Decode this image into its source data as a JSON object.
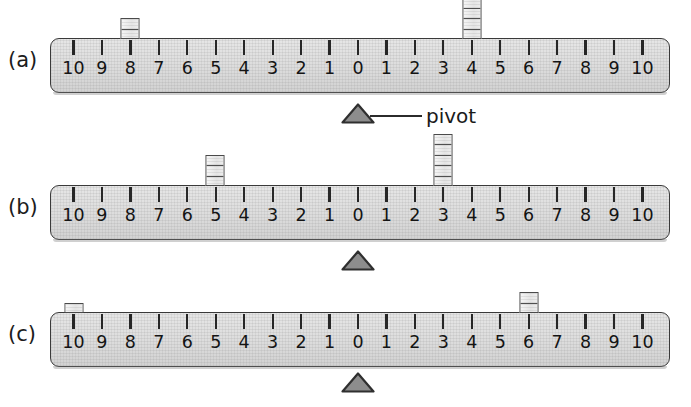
{
  "figure": {
    "background_color": "#ffffff",
    "beam_fill": "#e0e0e0",
    "beam_stroke": "#3a3a3a",
    "pivot_fill": "#8d8d8d",
    "pivot_stroke": "#2f2f2f",
    "weight_fill": "#ededed",
    "weight_stroke": "#4a4a4a",
    "tick_color": "#262626"
  },
  "scale_labels": [
    "10",
    "9",
    "8",
    "7",
    "6",
    "5",
    "4",
    "3",
    "2",
    "1",
    "0",
    "1",
    "2",
    "3",
    "4",
    "5",
    "6",
    "7",
    "8",
    "9",
    "10"
  ],
  "callout": {
    "label": "pivot"
  },
  "rows": [
    {
      "label": "(a)",
      "beam": {
        "left": 50,
        "top": 38,
        "width": 620,
        "height": 55
      },
      "pivot": {
        "position": 0,
        "x": 358,
        "top": 103,
        "width": 34,
        "height": 21
      },
      "weights": [
        {
          "position_label": "8",
          "side": "left",
          "value": 8,
          "x": 130,
          "segments": 2
        },
        {
          "position_label": "4",
          "side": "right",
          "value": 4,
          "x": 472,
          "segments": 4
        }
      ]
    },
    {
      "label": "(b)",
      "beam": {
        "left": 50,
        "top": 185,
        "width": 620,
        "height": 55
      },
      "pivot": {
        "position": 0,
        "x": 358,
        "top": 250,
        "width": 34,
        "height": 21
      },
      "weights": [
        {
          "position_label": "5",
          "side": "left",
          "value": 5,
          "x": 215,
          "segments": 3
        },
        {
          "position_label": "3",
          "side": "right",
          "value": 3,
          "x": 443,
          "segments": 5
        }
      ]
    },
    {
      "label": "(c)",
      "beam": {
        "left": 50,
        "top": 312,
        "width": 620,
        "height": 55
      },
      "pivot": {
        "position": 0,
        "x": 358,
        "top": 372,
        "width": 34,
        "height": 21
      },
      "weights": [
        {
          "position_label": "10",
          "side": "left",
          "value": 10,
          "x": 74,
          "segments": 1
        },
        {
          "position_label": "6",
          "side": "right",
          "value": 6,
          "x": 529,
          "segments": 2
        }
      ]
    }
  ]
}
